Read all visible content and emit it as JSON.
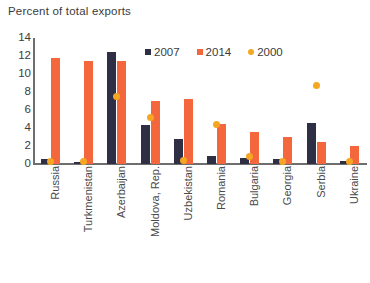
{
  "chart_data": {
    "type": "bar",
    "title": "Percent of total exports",
    "xlabel": "",
    "ylabel": "",
    "ylim": [
      0,
      14
    ],
    "yticks": [
      0,
      2,
      4,
      6,
      8,
      10,
      12,
      14
    ],
    "grid": false,
    "legend_position": "top-center",
    "categories": [
      "Russia",
      "Turkmenistan",
      "Azerbaijan",
      "Moldova, Rep.",
      "Uzbekistan",
      "Romania",
      "Bulgaria",
      "Georgia",
      "Serbia",
      "Ukraine"
    ],
    "series": [
      {
        "name": "2007",
        "type": "bar",
        "color": "#2e2e45",
        "values": [
          0.6,
          0.2,
          12.5,
          4.3,
          2.8,
          0.9,
          0.7,
          0.6,
          4.6,
          0.3
        ]
      },
      {
        "name": "2014",
        "type": "bar",
        "color": "#f4663c",
        "values": [
          11.8,
          11.5,
          11.4,
          7.0,
          7.2,
          4.5,
          3.6,
          3.0,
          2.5,
          2.0
        ]
      },
      {
        "name": "2000",
        "type": "scatter",
        "color": "#f5a623",
        "values": [
          0.3,
          0.3,
          7.5,
          5.2,
          0.4,
          4.4,
          0.8,
          0.3,
          8.7,
          0.3
        ]
      }
    ]
  },
  "legend": {
    "items": [
      {
        "label": "2007",
        "marker": "square",
        "color": "#2e2e45"
      },
      {
        "label": "2014",
        "marker": "square",
        "color": "#f4663c"
      },
      {
        "label": "2000",
        "marker": "circle",
        "color": "#f5a623"
      }
    ]
  }
}
